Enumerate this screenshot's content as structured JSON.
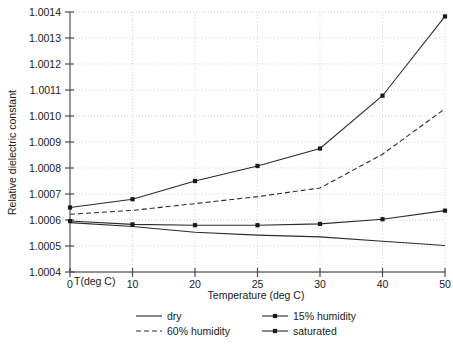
{
  "chart_data": {
    "type": "line",
    "title": "",
    "xlabel": "Temperature (deg C)",
    "ylabel": "Relative dielectric constant",
    "x_corner_label": "T(deg C)",
    "categories": [
      0,
      10,
      20,
      25,
      30,
      40,
      50
    ],
    "x_tick_labels": [
      "0",
      "10",
      "20",
      "25",
      "30",
      "40",
      "50"
    ],
    "y_tick_labels": [
      "1.0014",
      "1.0013",
      "1.0012",
      "1.0011",
      "1.0010",
      "1.0009",
      "1.0008",
      "1.0007",
      "1.0006",
      "1.0005",
      "1.0004"
    ],
    "y_tick_values": [
      1.0014,
      1.0013,
      1.0012,
      1.0011,
      1.001,
      1.0009,
      1.0008,
      1.0007,
      1.0006,
      1.0005,
      1.0004
    ],
    "ylim": [
      1.0004,
      1.0014
    ],
    "xlim": [
      0,
      50
    ],
    "grid": true,
    "legend_position": "below",
    "series": [
      {
        "name": "dry",
        "style": "solid",
        "markers": false,
        "color": "#2b2b2b",
        "values": [
          1.00059,
          1.000575,
          1.000553,
          1.000542,
          1.000535,
          1.000518,
          1.000502
        ]
      },
      {
        "name": "60% humidity",
        "style": "dashed",
        "markers": false,
        "color": "#2b2b2b",
        "values": [
          1.000622,
          1.000637,
          1.000663,
          1.00069,
          1.000723,
          1.000853,
          1.001028
        ]
      },
      {
        "name": "15% humidity",
        "style": "solid",
        "markers": true,
        "color": "#2b2b2b",
        "values": [
          1.000596,
          1.000583,
          1.00058,
          1.00058,
          1.000585,
          1.000603,
          1.000636
        ]
      },
      {
        "name": "saturated",
        "style": "solid",
        "markers": true,
        "color": "#2b2b2b",
        "values": [
          1.000648,
          1.00068,
          1.00075,
          1.000808,
          1.000875,
          1.001078,
          1.001383
        ]
      }
    ],
    "legend_entries": [
      {
        "label": "dry",
        "style": "solid",
        "markers": false
      },
      {
        "label": "15% humidity",
        "style": "solid",
        "markers": true
      },
      {
        "label": "60% humidity",
        "style": "dashed",
        "markers": false
      },
      {
        "label": "saturated",
        "style": "solid",
        "markers": true
      }
    ]
  }
}
